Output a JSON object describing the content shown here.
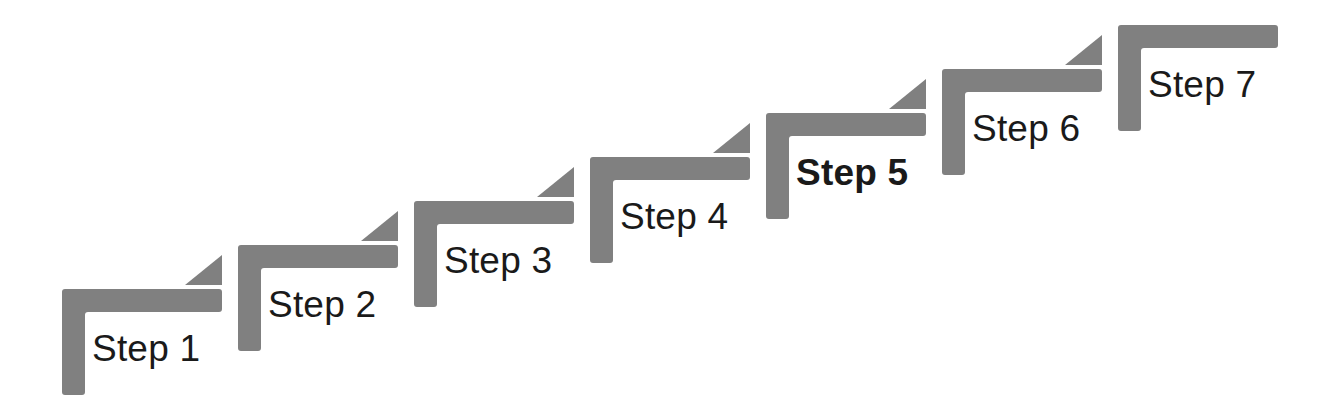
{
  "diagram": {
    "type": "staircase",
    "canvas": {
      "width": 1322,
      "height": 415
    },
    "style": {
      "shape_fill": "#808080",
      "label_color": "#1a1a1a",
      "background": "#ffffff",
      "bar_thickness": 23,
      "horizontal_bar_width": 160,
      "vertical_bar_height": 106,
      "triangle_width": 37,
      "triangle_height": 30,
      "step_offset_x": 176,
      "step_offset_y": -44,
      "label_font_size": 37
    },
    "steps": [
      {
        "id": "step-1",
        "label": "Step 1",
        "bold": false,
        "has_arrow_tip": true,
        "corner_x": 62,
        "corner_y": 289,
        "label_x": 92,
        "label_y": 330
      },
      {
        "id": "step-2",
        "label": "Step 2",
        "bold": false,
        "has_arrow_tip": true,
        "corner_x": 238,
        "corner_y": 245,
        "label_x": 268,
        "label_y": 286
      },
      {
        "id": "step-3",
        "label": "Step 3",
        "bold": false,
        "has_arrow_tip": true,
        "corner_x": 414,
        "corner_y": 201,
        "label_x": 444,
        "label_y": 242
      },
      {
        "id": "step-4",
        "label": "Step 4",
        "bold": false,
        "has_arrow_tip": true,
        "corner_x": 590,
        "corner_y": 157,
        "label_x": 620,
        "label_y": 198
      },
      {
        "id": "step-5",
        "label": "Step 5",
        "bold": true,
        "has_arrow_tip": true,
        "corner_x": 766,
        "corner_y": 113,
        "label_x": 796,
        "label_y": 154
      },
      {
        "id": "step-6",
        "label": "Step 6",
        "bold": false,
        "has_arrow_tip": true,
        "corner_x": 942,
        "corner_y": 69,
        "label_x": 972,
        "label_y": 110
      },
      {
        "id": "step-7",
        "label": "Step 7",
        "bold": false,
        "has_arrow_tip": false,
        "corner_x": 1118,
        "corner_y": 25,
        "label_x": 1148,
        "label_y": 66
      }
    ]
  }
}
